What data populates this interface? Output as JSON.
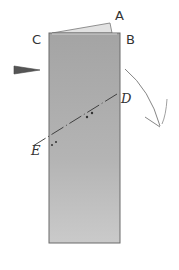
{
  "diagram": {
    "type": "folding-instruction",
    "labels": {
      "A": "A",
      "B": "B",
      "C": "C",
      "D": "D",
      "E": "E"
    },
    "colors": {
      "paper": "#a9a9a9",
      "paper_light": "#c8c8c8",
      "flap": "#dcdcdc",
      "outline": "#666666",
      "line": "#333333",
      "arrow": "#555555"
    }
  }
}
